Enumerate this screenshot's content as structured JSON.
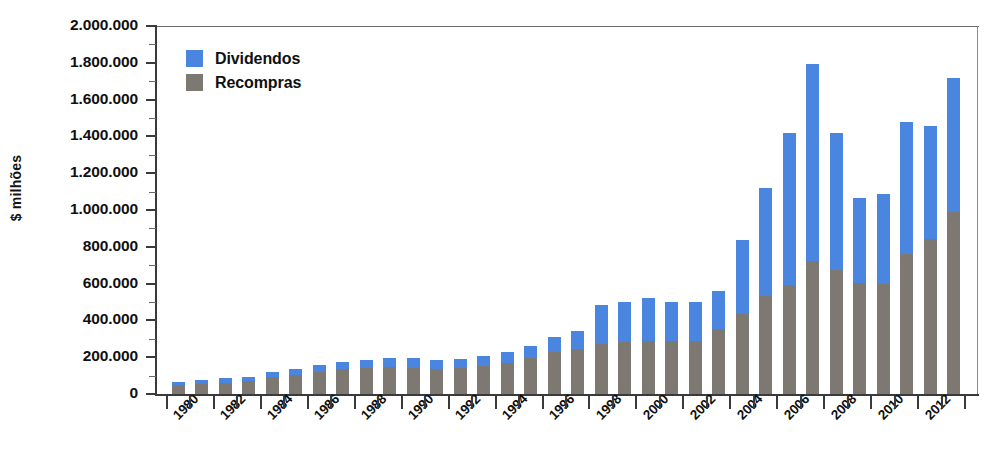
{
  "chart_data": {
    "type": "bar",
    "stacked": true,
    "title": "",
    "xlabel": "",
    "ylabel": "$ milhões",
    "ylim": [
      0,
      2000000
    ],
    "ytick_step": 200000,
    "grid": false,
    "legend_position": "top-left",
    "ytick_labels": [
      "2.000.000",
      "1.800.000",
      "1.600.000",
      "1.400.000",
      "1.200.000",
      "1.000.000",
      "800.000",
      "600.000",
      "400.000",
      "200.000",
      "0"
    ],
    "categories": [
      1980,
      1981,
      1982,
      1983,
      1984,
      1985,
      1986,
      1987,
      1988,
      1989,
      1990,
      1991,
      1992,
      1993,
      1994,
      1995,
      1996,
      1997,
      1998,
      1999,
      2000,
      2001,
      2002,
      2003,
      2004,
      2005,
      2006,
      2007,
      2008,
      2009,
      2010,
      2011,
      2012,
      2013
    ],
    "xtick_labels": [
      "1980",
      "1982",
      "1984",
      "1986",
      "1988",
      "1990",
      "1992",
      "1994",
      "1996",
      "1998",
      "2000",
      "2002",
      "2004",
      "2006",
      "2008",
      "2010",
      "2012"
    ],
    "series": [
      {
        "name": "Recompras",
        "color": "#7d7872",
        "values": [
          48000,
          55000,
          62000,
          70000,
          95000,
          105000,
          120000,
          135000,
          140000,
          145000,
          140000,
          135000,
          140000,
          150000,
          170000,
          195000,
          230000,
          245000,
          270000,
          280000,
          290000,
          290000,
          290000,
          355000,
          435000,
          530000,
          590000,
          725000,
          675000,
          605000,
          600000,
          760000,
          840000,
          990000
        ]
      },
      {
        "name": "Dividendos",
        "color": "#4a86e0",
        "values": [
          17000,
          20000,
          23000,
          25000,
          27000,
          30000,
          35000,
          40000,
          47000,
          52000,
          55000,
          50000,
          50000,
          55000,
          58000,
          68000,
          78000,
          95000,
          215000,
          220000,
          230000,
          210000,
          210000,
          205000,
          400000,
          590000,
          830000,
          1070000,
          745000,
          460000,
          485000,
          720000,
          615000,
          725000
        ]
      }
    ],
    "totals": [
      65000,
      75000,
      85000,
      95000,
      122000,
      135000,
      155000,
      175000,
      187000,
      197000,
      195000,
      185000,
      190000,
      205000,
      228000,
      263000,
      308000,
      340000,
      485000,
      500000,
      520000,
      500000,
      500000,
      560000,
      835000,
      1120000,
      1420000,
      1795000,
      1420000,
      1065000,
      1085000,
      1480000,
      1455000,
      1715000
    ]
  },
  "legend": {
    "items": [
      {
        "label": "Dividendos",
        "key": "div"
      },
      {
        "label": "Recompras",
        "key": "rec"
      }
    ]
  }
}
